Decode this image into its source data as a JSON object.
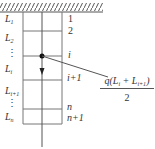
{
  "diagram": {
    "type": "hanging chain / suspended column segments",
    "colors": {
      "line": "#555555",
      "text": "#333333",
      "hatch": "#555555"
    },
    "left_labels": [
      {
        "base": "L",
        "sub": "1"
      },
      {
        "base": "L",
        "sub": "2"
      },
      {
        "base": "⋮",
        "sub": ""
      },
      {
        "base": "L",
        "sub": "i"
      },
      {
        "base": "L",
        "sub": "i+1"
      },
      {
        "base": "⋮",
        "sub": ""
      },
      {
        "base": "L",
        "sub": "n"
      }
    ],
    "right_labels": [
      "1",
      "2",
      "i",
      "i+1",
      "n",
      "n+1"
    ],
    "formula": {
      "numerator": "q(L",
      "numerator_sub1": "i",
      "numerator_mid": " + L",
      "numerator_sub2": "i+1",
      "numerator_end": ")",
      "denominator": "2"
    }
  }
}
